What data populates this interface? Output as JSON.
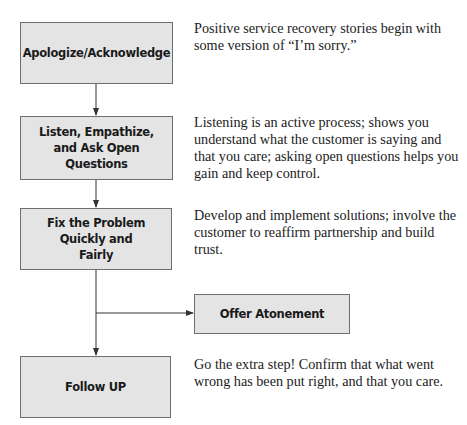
{
  "diagram": {
    "type": "flowchart",
    "steps": [
      {
        "label": "Apologize/Acknowledge",
        "description": "Positive service recovery stories begin with some version of “I’m sorry.”"
      },
      {
        "label": "Listen, Empathize, and Ask Open Questions",
        "description": "Listening is an active process; shows you understand what the customer is saying and that you care; asking open questions helps you gain and keep control."
      },
      {
        "label": "Fix the Problem Quickly and Fairly",
        "description": "Develop and implement solutions; involve the customer to reaffirm partnership and build trust."
      },
      {
        "label": "Follow UP",
        "description": "Go the extra step! Confirm that what went wrong has been put right, and that you care."
      }
    ],
    "branch": {
      "label": "Offer Atonement"
    },
    "colors": {
      "box_fill": "#e4e4e4",
      "box_border": "#6e6e6e",
      "connector": "#333333"
    }
  }
}
